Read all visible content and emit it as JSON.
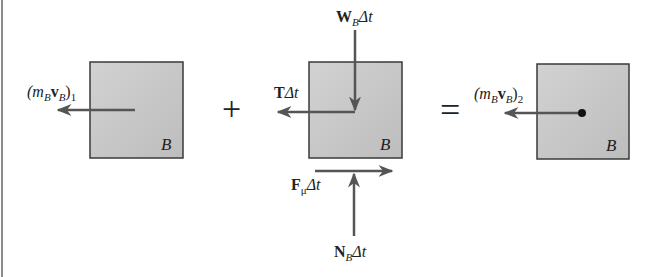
{
  "diagram": {
    "colors": {
      "box_fill": "#c9c9c9",
      "box_stroke": "#3a3a3a",
      "arrow": "#555555",
      "text": "#222222",
      "border": "#8a8a8a"
    },
    "panels": [
      {
        "id": "initial-momentum",
        "box_label": "B",
        "vectors": [
          {
            "label_main": "(m",
            "label_sub1": "B",
            "label_bold": "v",
            "label_sub2": "B",
            "label_close": ")",
            "label_subscript": "1",
            "direction": "left"
          }
        ]
      },
      {
        "id": "impulses",
        "box_label": "B",
        "vectors": [
          {
            "label_bold": "W",
            "label_sub": "B",
            "label_rest": "Δt",
            "direction": "down"
          },
          {
            "label_bold": "T",
            "label_rest": "Δt",
            "direction": "left"
          },
          {
            "label_bold": "F",
            "label_sub": "μ",
            "label_rest": "Δt",
            "direction": "right"
          },
          {
            "label_bold": "N",
            "label_sub": "B",
            "label_rest": "Δt",
            "direction": "up"
          }
        ]
      },
      {
        "id": "final-momentum",
        "box_label": "B",
        "vectors": [
          {
            "label_main": "(m",
            "label_sub1": "B",
            "label_bold": "v",
            "label_sub2": "B",
            "label_close": ")",
            "label_subscript": "2",
            "direction": "left"
          }
        ]
      }
    ],
    "operators": {
      "plus": "+",
      "equals": "="
    }
  }
}
